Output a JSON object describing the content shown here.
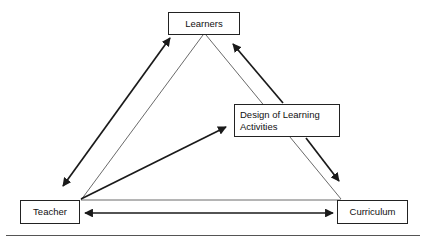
{
  "diagram": {
    "background_color": "#ffffff",
    "line_color": "#222222",
    "text_color": "#111111",
    "nodes": [
      {
        "id": "learners",
        "label": "Learners",
        "x": 168,
        "y": 12,
        "w": 72,
        "h": 23
      },
      {
        "id": "design",
        "label": "Design of Learning\nActivities",
        "x": 234,
        "y": 104,
        "w": 106,
        "h": 33
      },
      {
        "id": "teacher",
        "label": "Teacher",
        "x": 20,
        "y": 200,
        "w": 60,
        "h": 24
      },
      {
        "id": "curriculum",
        "label": "Curriculum",
        "x": 337,
        "y": 200,
        "w": 71,
        "h": 24
      }
    ],
    "connectors": [
      {
        "id": "teacher-learners",
        "from": "teacher",
        "to": "learners",
        "style": "thick",
        "arrowheads": "both"
      },
      {
        "id": "learners-design",
        "from": "design",
        "to": "learners",
        "style": "thick",
        "arrowheads": "end"
      },
      {
        "id": "design-curriculum",
        "from": "design",
        "to": "curriculum",
        "style": "thick",
        "arrowheads": "end"
      },
      {
        "id": "teacher-design",
        "from": "teacher",
        "to": "design",
        "style": "thick",
        "arrowheads": "end"
      },
      {
        "id": "teacher-curriculum",
        "from": "teacher",
        "to": "curriculum",
        "style": "thick",
        "arrowheads": "both"
      },
      {
        "id": "triangle-left",
        "from": "teacher",
        "to": "learners",
        "style": "thin",
        "arrowheads": "none"
      },
      {
        "id": "triangle-right",
        "from": "learners",
        "to": "curriculum",
        "style": "thin",
        "arrowheads": "none"
      },
      {
        "id": "triangle-base",
        "from": "teacher",
        "to": "curriculum",
        "style": "thin",
        "arrowheads": "none"
      }
    ],
    "bottom_rule": {
      "visible": true,
      "color": "#555555"
    }
  }
}
